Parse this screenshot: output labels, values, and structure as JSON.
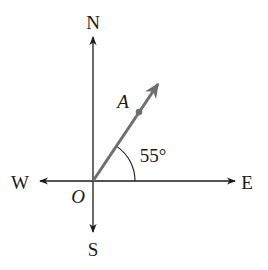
{
  "diagram": {
    "type": "compass-bearing",
    "origin_label": "O",
    "directions": {
      "north": "N",
      "south": "S",
      "east": "E",
      "west": "W"
    },
    "ray": {
      "point_label": "A",
      "angle_label": "55°",
      "angle_from": "E",
      "angle_degrees": 55
    },
    "colors": {
      "axis": "#1a1a1a",
      "ray": "#6e6e6e",
      "background": "#ffffff"
    }
  }
}
